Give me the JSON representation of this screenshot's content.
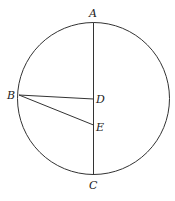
{
  "diagram": {
    "type": "circle-geometry",
    "background": "#ffffff",
    "stroke_color": "#333333",
    "circle": {
      "cx": 93.5,
      "cy": 98.5,
      "r": 76
    },
    "points": {
      "A": {
        "label": "A",
        "x": 93.5,
        "y": 22.5,
        "label_x": 91,
        "label_y": 17
      },
      "B": {
        "label": "B",
        "x": 19,
        "y": 95,
        "label_x": 8,
        "label_y": 99
      },
      "C": {
        "label": "C",
        "x": 93.5,
        "y": 175,
        "label_x": 89,
        "label_y": 190
      },
      "D": {
        "label": "D",
        "x": 93.5,
        "y": 99,
        "label_x": 97,
        "label_y": 103
      },
      "E": {
        "label": "E",
        "x": 93.5,
        "y": 125,
        "label_x": 96,
        "label_y": 131
      }
    },
    "segments": [
      {
        "from": "A",
        "to": "C"
      },
      {
        "from": "B",
        "to": "D"
      },
      {
        "from": "B",
        "to": "E"
      }
    ]
  }
}
